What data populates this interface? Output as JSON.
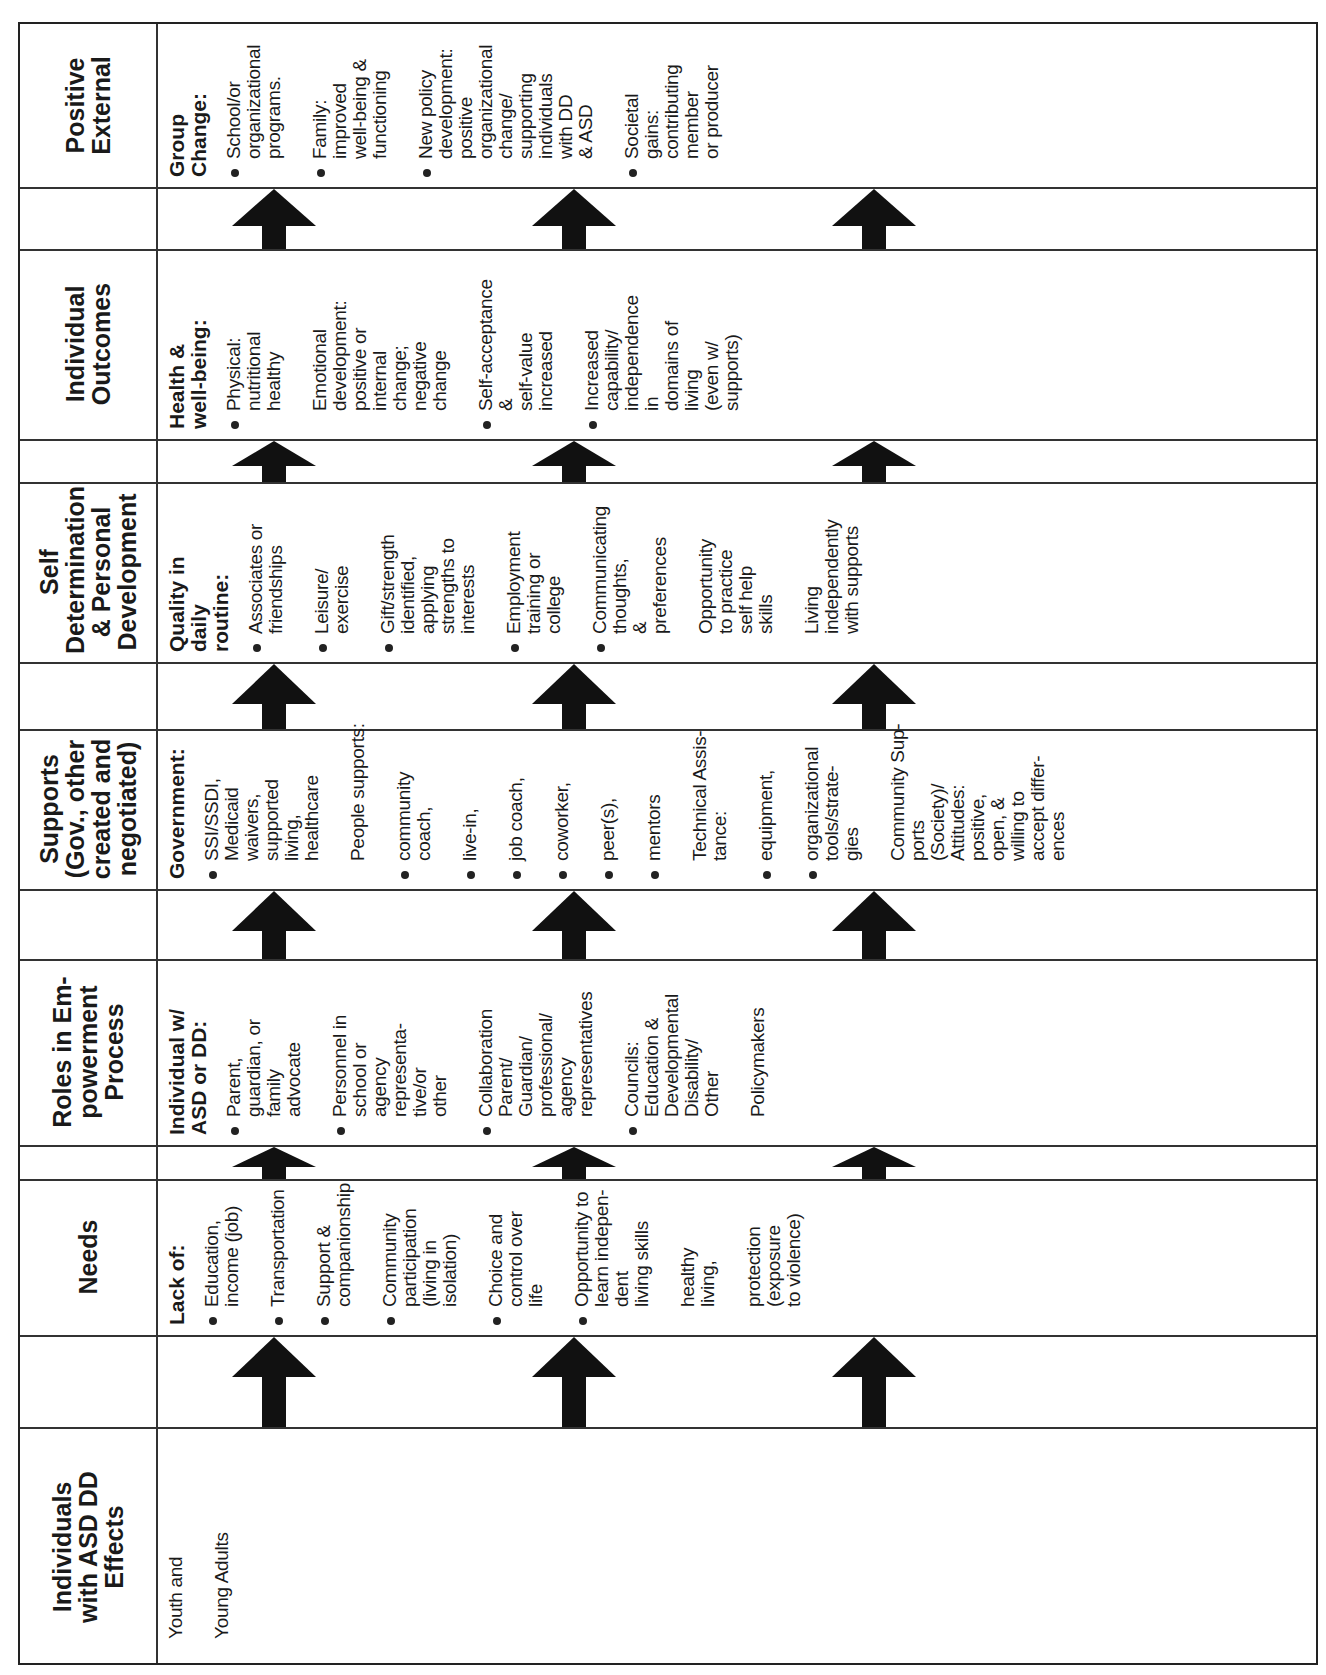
{
  "rows": [
    {
      "header": [
        "Positive",
        "External"
      ],
      "subheading": [
        "Group",
        "Change:"
      ],
      "items": [
        {
          "bullet": true,
          "lines": [
            "School/or",
            "organizational",
            "programs."
          ]
        },
        {
          "bullet": true,
          "lines": [
            "Family:",
            "improved",
            "well-being &",
            "functioning"
          ]
        },
        {
          "bullet": true,
          "lines": [
            "New policy",
            "development:",
            "positive",
            "organizational",
            "change/",
            "supporting",
            "individuals",
            "with DD",
            "& ASD"
          ]
        },
        {
          "bullet": true,
          "lines": [
            "Societal",
            "gains:",
            "contributing",
            "member",
            "or producer"
          ]
        }
      ]
    },
    {
      "header": [
        "Individual",
        "Outcomes"
      ],
      "subheading": [
        "Health &",
        "well-being:"
      ],
      "items": [
        {
          "bullet": true,
          "lines": [
            "Physical:",
            "nutritional",
            "healthy"
          ]
        },
        {
          "bullet": false,
          "lines": [
            "Emotional",
            "development:",
            "positive or",
            "internal",
            "change;",
            "negative",
            "change"
          ]
        },
        {
          "bullet": true,
          "lines": [
            "Self-acceptance",
            "&",
            "self-value",
            "increased"
          ]
        },
        {
          "bullet": true,
          "lines": [
            "Increased",
            "capability/",
            "independence",
            "in",
            "domains of",
            "living",
            "(even w/",
            "supports)"
          ]
        }
      ]
    },
    {
      "header": [
        "Self",
        "Determination",
        "& Personal",
        "Development"
      ],
      "subheading": [
        "Quality in",
        "daily",
        "routine:"
      ],
      "items": [
        {
          "bullet": true,
          "lines": [
            "Associates or",
            "friendships"
          ]
        },
        {
          "bullet": true,
          "lines": [
            "Leisure/",
            "exercise"
          ]
        },
        {
          "bullet": true,
          "lines": [
            "Gift/strength",
            "identified,",
            "applying",
            "strengths to",
            "interests"
          ]
        },
        {
          "bullet": true,
          "lines": [
            "Employment",
            "training or",
            "college"
          ]
        },
        {
          "bullet": true,
          "lines": [
            "Communicating",
            "thoughts,",
            "&",
            "preferences"
          ]
        },
        {
          "bullet": false,
          "lines": [
            "Opportunity",
            "to practice",
            "self help",
            "skills"
          ]
        },
        {
          "bullet": false,
          "lines": [
            "Living",
            "independently",
            "with supports"
          ]
        }
      ]
    },
    {
      "header": [
        "Supports",
        "(Gov., other",
        "created and",
        "negotiated)"
      ],
      "subheading": [
        "Government:"
      ],
      "items": [
        {
          "bullet": true,
          "lines": [
            "SSI/SSDI,",
            "Medicaid",
            "waivers,",
            "supported",
            "living,",
            "healthcare"
          ]
        },
        {
          "bullet": false,
          "lines": [
            "People supports:"
          ]
        },
        {
          "bullet": true,
          "lines": [
            "community",
            "coach,"
          ]
        },
        {
          "bullet": true,
          "lines": [
            "live-in,"
          ]
        },
        {
          "bullet": true,
          "lines": [
            "job coach,"
          ]
        },
        {
          "bullet": true,
          "lines": [
            "coworker,"
          ]
        },
        {
          "bullet": true,
          "lines": [
            "peer(s),"
          ]
        },
        {
          "bullet": true,
          "lines": [
            "mentors"
          ]
        },
        {
          "bullet": false,
          "lines": [
            "Technical Assis-",
            "tance:"
          ]
        },
        {
          "bullet": true,
          "lines": [
            "equipment,"
          ]
        },
        {
          "bullet": true,
          "lines": [
            "organizational",
            "tools/strate-",
            "gies"
          ]
        },
        {
          "bullet": false,
          "lines": [
            "Community Sup-",
            "ports",
            "(Society)/",
            "Attitudes:",
            "positive,",
            "open, &",
            "willing to",
            "accept differ-",
            "ences"
          ]
        }
      ]
    },
    {
      "header": [
        "Roles in Em-",
        "powerment",
        "Process"
      ],
      "subheading": [
        "Individual w/",
        "ASD or DD:"
      ],
      "items": [
        {
          "bullet": true,
          "lines": [
            "Parent,",
            "guardian, or",
            "family",
            "advocate"
          ]
        },
        {
          "bullet": true,
          "lines": [
            "Personnel in",
            "school or",
            "agency",
            "representa-",
            "tive/or",
            "other"
          ]
        },
        {
          "bullet": true,
          "lines": [
            "Collaboration",
            "Parent/",
            "Guardian/",
            "professional/",
            "agency",
            "representatives"
          ]
        },
        {
          "bullet": true,
          "lines": [
            "Councils:",
            "Education &",
            "Developmental",
            "Disability/",
            "Other"
          ]
        },
        {
          "bullet": false,
          "lines": [
            "Policymakers"
          ]
        }
      ]
    },
    {
      "header": [
        "Needs"
      ],
      "subheading": [
        "Lack of:"
      ],
      "items": [
        {
          "bullet": true,
          "lines": [
            "Education,",
            "income (job)"
          ]
        },
        {
          "bullet": true,
          "lines": [
            "Transportation"
          ]
        },
        {
          "bullet": true,
          "lines": [
            "Support &",
            "companionship"
          ]
        },
        {
          "bullet": true,
          "lines": [
            "Community",
            "participation",
            "(living in",
            "isolation)"
          ]
        },
        {
          "bullet": true,
          "lines": [
            "Choice and",
            "control over",
            "life"
          ]
        },
        {
          "bullet": true,
          "lines": [
            "Opportunity to",
            "learn indepen-",
            "dent",
            "living skills"
          ]
        },
        {
          "bullet": false,
          "lines": [
            "healthy",
            "living,"
          ]
        },
        {
          "bullet": false,
          "lines": [
            "protection",
            "(exposure",
            "to violence)"
          ]
        }
      ]
    },
    {
      "header": [
        "Individuals",
        "with ASD DD",
        "Effects"
      ],
      "subheading": [],
      "items": [
        {
          "bullet": false,
          "lines": [
            "Youth and"
          ]
        },
        {
          "bullet": false,
          "lines": [
            "Young Adults"
          ]
        }
      ]
    }
  ],
  "arrows": {
    "icon": "up-arrow-icon",
    "count_per_row": 3
  }
}
